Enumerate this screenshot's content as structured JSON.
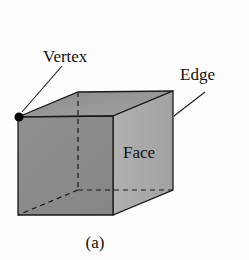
{
  "diagram": {
    "type": "cube-anatomy",
    "labels": {
      "vertex": "Vertex",
      "edge": "Edge",
      "face": "Face"
    },
    "caption": "(a)",
    "colors": {
      "front_face": "#8e8e8e",
      "top_face": "#9c9c9c",
      "side_face": "#ababab",
      "stroke": "#1a1a1a",
      "vertex_dot": "#000000",
      "background": "#fdfdfd"
    }
  }
}
